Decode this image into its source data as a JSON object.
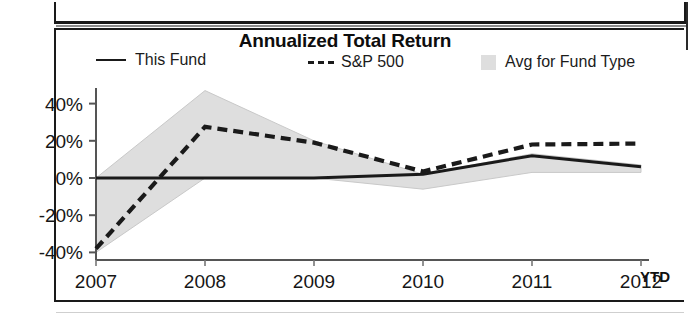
{
  "chart_data": {
    "type": "line",
    "title": "Annualized Total Return",
    "xlabel": "",
    "ylabel": "",
    "x": [
      "2007",
      "2008",
      "2009",
      "2010",
      "2011",
      "2012 YTD"
    ],
    "categories": [
      "2007",
      "2008",
      "2009",
      "2010",
      "2011",
      "2012 YTD"
    ],
    "ylim": [
      -40,
      50
    ],
    "yticks": [
      40,
      20,
      0,
      -20,
      -40
    ],
    "ytick_labels": [
      "40%",
      "20%",
      "0%",
      "-20%",
      "-40%"
    ],
    "grid": false,
    "legend_position": "top",
    "series": [
      {
        "name": "This Fund",
        "style": "solid",
        "color": "#1a1a1a",
        "values": [
          0,
          0,
          0,
          2,
          12,
          6
        ]
      },
      {
        "name": "S&P 500",
        "style": "dashed",
        "color": "#1a1a1a",
        "values": [
          -38,
          27.5,
          19,
          3.5,
          18,
          18.5
        ]
      },
      {
        "name": "Avg for Fund Type",
        "style": "band",
        "color": "#dedede",
        "band_upper": [
          0,
          47,
          20,
          2,
          13,
          7
        ],
        "band_lower": [
          -40,
          0,
          0,
          -6,
          3,
          3
        ]
      }
    ]
  },
  "chart": {
    "title": "Annualized Total Return",
    "axis": {
      "y_ticks": [
        "40%",
        "20%",
        "0%",
        "-20%",
        "-40%"
      ],
      "x_ticks": [
        "2007",
        "2008",
        "2009",
        "2010",
        "2011",
        "2012"
      ],
      "x_suffix": "YTD"
    },
    "legend": {
      "items": [
        {
          "label": "This Fund",
          "marker": "solid-line-swatch"
        },
        {
          "label": "S&P 500",
          "marker": "dashed-line-swatch"
        },
        {
          "label": "Avg for Fund Type",
          "marker": "area-swatch"
        }
      ]
    }
  }
}
